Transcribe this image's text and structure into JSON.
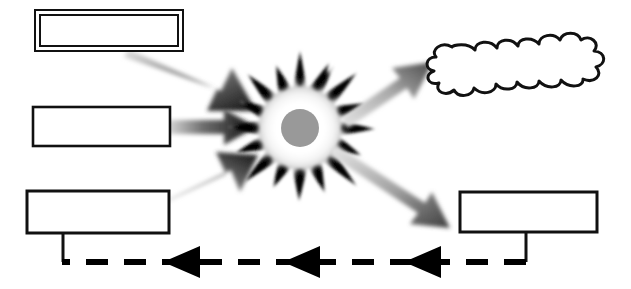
{
  "diagram": {
    "title": "",
    "type": "blank-flow-diagram",
    "background_color": "#ffffff",
    "stroke_color": "#111111",
    "burst_core_color": "#999999",
    "burst_ring_color": "#ffffff",
    "burst_spike_color": "#000000",
    "arrow_gradient_from": "#dcdcdc",
    "arrow_gradient_to": "#1a1a1a",
    "dashed_line_color": "#000000"
  },
  "nodes": {
    "input_top": {
      "label": "",
      "shape": "double-rectangle"
    },
    "input_middle": {
      "label": "",
      "shape": "rectangle"
    },
    "input_bottom": {
      "label": "",
      "shape": "rectangle"
    },
    "center_burst": {
      "label": "",
      "shape": "starburst"
    },
    "output_cloud": {
      "label": "",
      "shape": "cloud"
    },
    "output_box": {
      "label": "",
      "shape": "rectangle"
    }
  },
  "connectors": {
    "input_top_to_burst": {
      "label": "",
      "style": "gradient-arrow"
    },
    "input_middle_to_burst": {
      "label": "",
      "style": "gradient-arrow"
    },
    "input_bottom_to_burst": {
      "label": "",
      "style": "gradient-arrow"
    },
    "burst_to_cloud": {
      "label": "",
      "style": "gradient-arrow"
    },
    "burst_to_output_box": {
      "label": "",
      "style": "gradient-arrow"
    },
    "feedback_line": {
      "label": "",
      "style": "dashed-arrow-left",
      "arrowhead_count": 3
    }
  }
}
